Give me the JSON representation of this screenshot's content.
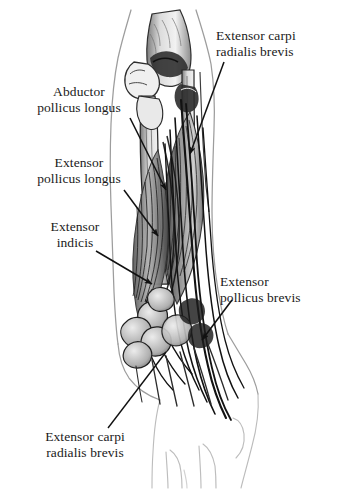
{
  "figure": {
    "kind": "anatomical-illustration",
    "style": "grayscale pencil and ink drawing",
    "background_color": "#ffffff",
    "ink_color": "#111111",
    "outline_color": "#9a9a9a",
    "view": "posterior (dorsal) right forearm, elbow at top, hand at bottom",
    "structures": [
      "olecranon and distal humerus",
      "radius shaft",
      "ulna shaft",
      "extensor muscle bellies",
      "extensor tendons",
      "carpal bones",
      "metacarpals",
      "hand web spaces"
    ]
  },
  "labels": [
    {
      "id": "extensor-carpi-radialis-brevis-top",
      "lines": [
        "Extensor carpi",
        "radialis brevis"
      ],
      "position": "top-right",
      "leader": "arrow pointing down-left to lateral muscle belly"
    },
    {
      "id": "abductor-pollicus-longus",
      "lines": [
        "Abductor",
        "pollicus longus"
      ],
      "position": "upper-left",
      "leader": "arrow pointing down-right to mid forearm"
    },
    {
      "id": "extensor-pollicus-longus",
      "lines": [
        "Extensor",
        "pollicus longus"
      ],
      "position": "mid-left",
      "leader": "arrow pointing down-right to mid forearm"
    },
    {
      "id": "extensor-indicis",
      "lines": [
        "Extensor",
        "indicis"
      ],
      "position": "lower-left",
      "leader": "arrow pointing down-right to distal muscle belly"
    },
    {
      "id": "extensor-pollicus-brevis",
      "lines": [
        "Extensor",
        "pollicus brevis"
      ],
      "position": "right",
      "leader": "arrow pointing down-left to wrist tendons"
    },
    {
      "id": "extensor-carpi-radialis-brevis-bottom",
      "lines": [
        "Extensor carpi",
        "radialis brevis"
      ],
      "position": "bottom-left",
      "leader": "line running up-right to dorsal wrist tendon"
    }
  ]
}
